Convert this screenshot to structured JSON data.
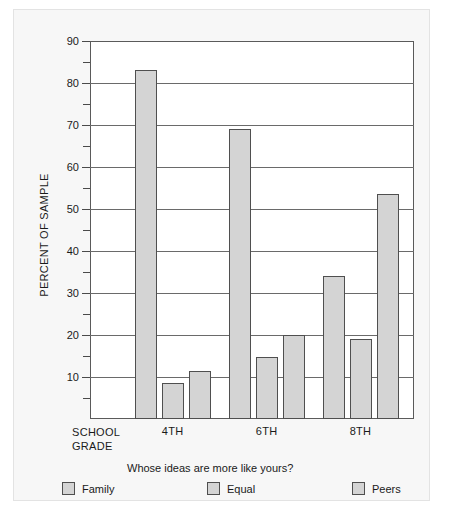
{
  "chart_data": {
    "type": "bar",
    "title": "",
    "xlabel": "SCHOOL GRADE",
    "ylabel": "PERCENT OF SAMPLE",
    "legend_title": "Whose ideas are more like yours?",
    "legend_position": "bottom",
    "grid": true,
    "ylim": [
      0,
      90
    ],
    "yticks": [
      10,
      20,
      30,
      40,
      50,
      60,
      70,
      80,
      90
    ],
    "ytick_labels": [
      "10",
      "20",
      "30",
      "40",
      "50",
      "60",
      "70",
      "80",
      "90"
    ],
    "yminor_ticks": [
      5,
      15,
      25,
      35,
      45,
      55,
      65,
      75,
      85
    ],
    "categories": [
      "4TH",
      "6TH",
      "8TH"
    ],
    "series": [
      {
        "name": "Family",
        "values": [
          83,
          69,
          34
        ]
      },
      {
        "name": "Equal",
        "values": [
          8.5,
          14.8,
          19
        ]
      },
      {
        "name": "Peers",
        "values": [
          11.5,
          20,
          53.5
        ]
      }
    ],
    "bar_fill": "#d4d4d4",
    "bar_stroke": "#4f4f4f",
    "axis_color": "#5a5a5a",
    "grid_color": "#6a6a6a",
    "background": "#f7f7f7",
    "plot_background": "#ffffff"
  },
  "axis": {
    "y_title": "PERCENT OF SAMPLE",
    "x_title_line1": "SCHOOL",
    "x_title_line2": "GRADE"
  }
}
